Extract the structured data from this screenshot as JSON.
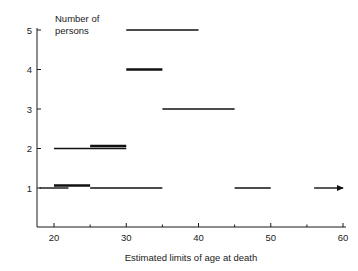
{
  "chart_data": {
    "type": "bar",
    "title": "",
    "subtitle": "",
    "xlabel": "Estimated limits of age at death",
    "ylabel": "Number of persons",
    "ylabel_lines": [
      "Number of",
      "persons"
    ],
    "xlim": [
      18,
      60
    ],
    "ylim": [
      0,
      5
    ],
    "grid": false,
    "legend": null,
    "xticks": [
      20,
      30,
      40,
      50,
      60
    ],
    "xtick_labels": [
      "20",
      "30",
      "40",
      "50",
      "60"
    ],
    "xminor_ticks": [
      25,
      35,
      45,
      55
    ],
    "yticks": [
      1,
      2,
      3,
      4,
      5
    ],
    "ytick_labels": [
      "1",
      "2",
      "3",
      "4",
      "5"
    ],
    "orientation": "horizontal-range-segments",
    "segments": [
      {
        "id": "seg-y1-a",
        "y": 1,
        "x_start": 18,
        "x_end": 22,
        "weight": "thin",
        "offset": 0,
        "open_ended": false
      },
      {
        "id": "seg-y1-b",
        "y": 1,
        "x_start": 20,
        "x_end": 25,
        "weight": "thick",
        "offset": -2.5,
        "open_ended": false
      },
      {
        "id": "seg-y1-c",
        "y": 1,
        "x_start": 25,
        "x_end": 35,
        "weight": "thin",
        "offset": 0,
        "open_ended": false
      },
      {
        "id": "seg-y1-d",
        "y": 1,
        "x_start": 45,
        "x_end": 50,
        "weight": "thin",
        "offset": 0,
        "open_ended": false
      },
      {
        "id": "seg-y1-e",
        "y": 1,
        "x_start": 56,
        "x_end": 60,
        "weight": "thin",
        "offset": 0,
        "open_ended": true
      },
      {
        "id": "seg-y2-a",
        "y": 2,
        "x_start": 20,
        "x_end": 30,
        "weight": "thin",
        "offset": 0,
        "open_ended": false
      },
      {
        "id": "seg-y2-b",
        "y": 2,
        "x_start": 25,
        "x_end": 30,
        "weight": "thick",
        "offset": -2.5,
        "open_ended": false
      },
      {
        "id": "seg-y3-a",
        "y": 3,
        "x_start": 35,
        "x_end": 45,
        "weight": "thin",
        "offset": 0,
        "open_ended": false
      },
      {
        "id": "seg-y4-a",
        "y": 4,
        "x_start": 30,
        "x_end": 35,
        "weight": "thick",
        "offset": 0,
        "open_ended": false
      },
      {
        "id": "seg-y5-a",
        "y": 5,
        "x_start": 30,
        "x_end": 40,
        "weight": "thin",
        "offset": 0,
        "open_ended": false
      }
    ],
    "colors": {
      "axis": "#1a1a1a",
      "segment": "#111111",
      "background": "#ffffff",
      "text": "#1a1a1a"
    }
  }
}
